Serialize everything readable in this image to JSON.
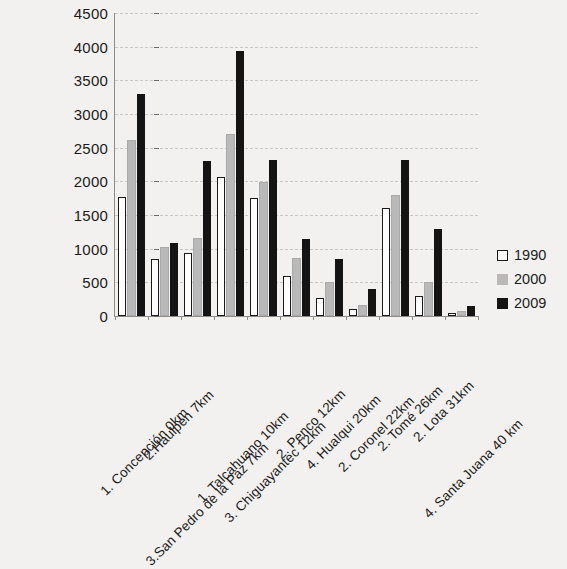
{
  "chart_data": {
    "type": "bar",
    "title": "",
    "subtitle": "",
    "xlabel": "",
    "ylabel": "",
    "ylim": [
      0,
      4500
    ],
    "ytick_step": 500,
    "yticks": [
      0,
      500,
      1000,
      1500,
      2000,
      2500,
      3000,
      3500,
      4000,
      4500
    ],
    "ytick_labels": [
      "0",
      "500",
      "1000",
      "1500",
      "2000",
      "2500",
      "3000",
      "3500",
      "4000",
      "4500"
    ],
    "grid": true,
    "grid_axis": "y",
    "legend_position": "right",
    "categories": [
      "1. Concepción 0km",
      "2.Haulpén 7km",
      "3.San Pedro de la Paz 7km",
      "1. Talcahuano 10km",
      "3. Chiguayantec 12km",
      "2. Penco 12km",
      "4. Hualqui 20km",
      "2. Coronel 22km",
      "2. Tomé 26km",
      "2. Lota 31km",
      "4. Santa Juana 40 km"
    ],
    "series": [
      {
        "name": "1990",
        "color": "#ffffff",
        "edge_color": "#1a1a1a",
        "values": [
          1770,
          850,
          940,
          2060,
          1760,
          590,
          270,
          110,
          1600,
          300,
          40
        ]
      },
      {
        "name": "2000",
        "color": "#b9b9b9",
        "edge_color": "#b9b9b9",
        "values": [
          2620,
          1020,
          1160,
          2710,
          1990,
          860,
          500,
          170,
          1800,
          510,
          75
        ]
      },
      {
        "name": "2009",
        "color": "#141414",
        "edge_color": "#141414",
        "values": [
          3300,
          1080,
          2300,
          3930,
          2320,
          1150,
          850,
          400,
          2320,
          1290,
          155
        ]
      }
    ]
  },
  "legend": {
    "items": [
      {
        "label": "1990",
        "swatch": "legend-swatch-1990"
      },
      {
        "label": "2000",
        "swatch": "legend-swatch-2000"
      },
      {
        "label": "2009",
        "swatch": "legend-swatch-2009"
      }
    ]
  }
}
